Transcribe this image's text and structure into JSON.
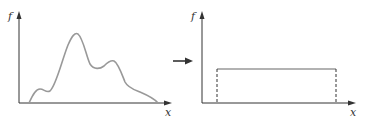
{
  "left_plot": {
    "y_label": "f",
    "x_label": "x",
    "curve": "multimodal density with main peak and two smaller bumps"
  },
  "transform_arrow": "right-arrow",
  "right_plot": {
    "y_label": "f",
    "x_label": "x",
    "curve": "uniform (rectangular) density with dashed edges"
  },
  "colors": {
    "axis": "#333333",
    "curve": "#999999"
  }
}
